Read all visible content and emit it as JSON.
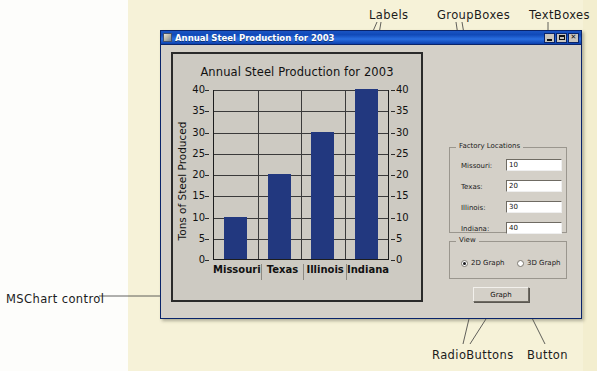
{
  "annotations": [
    {
      "id": "labels",
      "text": "Labels"
    },
    {
      "id": "groupboxes",
      "text": "GroupBoxes"
    },
    {
      "id": "textboxes",
      "text": "TextBoxes"
    },
    {
      "id": "mschart",
      "text": "MSChart control"
    },
    {
      "id": "radiobuttons",
      "text": "RadioButtons"
    },
    {
      "id": "button",
      "text": "Button"
    }
  ],
  "window": {
    "title": "Annual Steel Production for 2003",
    "icon": "application-icon",
    "controls": {
      "minimize": "minimize-button",
      "maximize": "maximize-button",
      "close_label": "✕"
    }
  },
  "chart_data": {
    "type": "bar",
    "title": "Annual Steel Production for 2003",
    "categories": [
      "Missouri",
      "Texas",
      "Illinois",
      "Indiana"
    ],
    "values": [
      10,
      20,
      30,
      40
    ],
    "xlabel": "",
    "ylabel": "Tons of Steel Produced",
    "ylim": [
      0,
      40
    ],
    "yticks": [
      40,
      35,
      30,
      25,
      20,
      15,
      10,
      5,
      0
    ],
    "grid": true,
    "legend": "none",
    "bar_color": "#22387f",
    "plot_background": "#cdcac2",
    "dual_y_axis": true
  },
  "form": {
    "factory_group": {
      "title": "Factory Locations",
      "fields": [
        {
          "label": "Missouri:",
          "value": "10"
        },
        {
          "label": "Texas:",
          "value": "20"
        },
        {
          "label": "Illinois:",
          "value": "30"
        },
        {
          "label": "Indiana:",
          "value": "40"
        }
      ]
    },
    "view_group": {
      "title": "View",
      "options": [
        {
          "label": "2D Graph",
          "selected": true
        },
        {
          "label": "3D Graph",
          "selected": false
        }
      ]
    },
    "graph_button": "Graph"
  },
  "colors": {
    "page_background": "#f6f2d8",
    "form_face": "#d4d0c8",
    "titlebar": "#1049b8",
    "bar": "#22387f"
  }
}
